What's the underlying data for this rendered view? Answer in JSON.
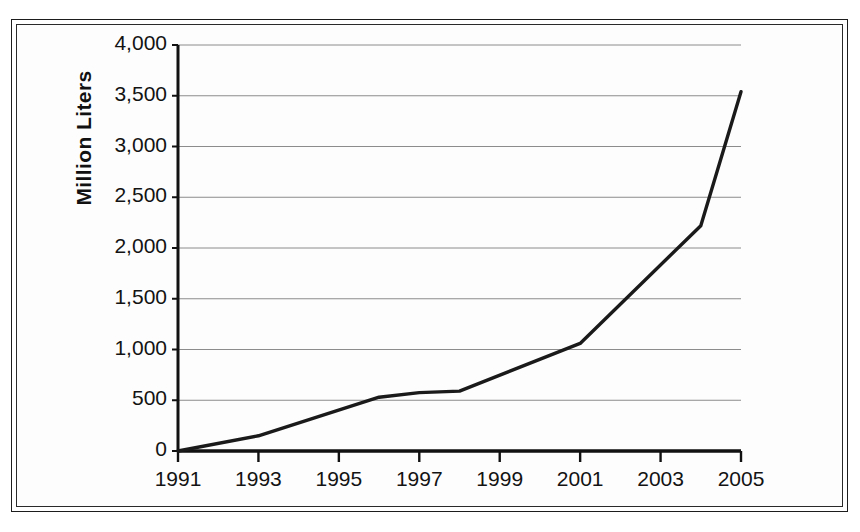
{
  "figure": {
    "frame_style": "double-line-border",
    "background_color": "#ffffff",
    "line_color": "#1a1a1a",
    "grid_color": "#8c8c8c",
    "axis_color": "#111111"
  },
  "axis": {
    "y_label": "Million Liters",
    "y_ticks": [
      "0",
      "500",
      "1,000",
      "1,500",
      "2,000",
      "2,500",
      "3,000",
      "3,500",
      "4,000"
    ],
    "x_ticks": [
      "1991",
      "1993",
      "1995",
      "1997",
      "1999",
      "2001",
      "2003",
      "2005"
    ]
  },
  "chart_data": {
    "type": "line",
    "title": "",
    "subtitle": "",
    "xlabel": "",
    "ylabel": "Million Liters",
    "xlim": [
      1991,
      2005
    ],
    "ylim": [
      0,
      4000
    ],
    "ytick_values": [
      0,
      500,
      1000,
      1500,
      2000,
      2500,
      3000,
      3500,
      4000
    ],
    "xtick_values": [
      1991,
      1993,
      1995,
      1997,
      1999,
      2001,
      2003,
      2005
    ],
    "grid": "horizontal",
    "legend": "none",
    "x": [
      1991,
      1993,
      1996,
      1997,
      1998,
      2001,
      2004,
      2005
    ],
    "values": [
      0,
      150,
      530,
      575,
      590,
      1060,
      2220,
      3540
    ],
    "series": [
      {
        "name": "Million Liters",
        "color": "#1a1a1a",
        "points": [
          {
            "x": 1991,
            "y": 0
          },
          {
            "x": 1993,
            "y": 150
          },
          {
            "x": 1996,
            "y": 530
          },
          {
            "x": 1997,
            "y": 575
          },
          {
            "x": 1998,
            "y": 590
          },
          {
            "x": 2001,
            "y": 1060
          },
          {
            "x": 2004,
            "y": 2220
          },
          {
            "x": 2005,
            "y": 3540
          }
        ]
      }
    ]
  }
}
